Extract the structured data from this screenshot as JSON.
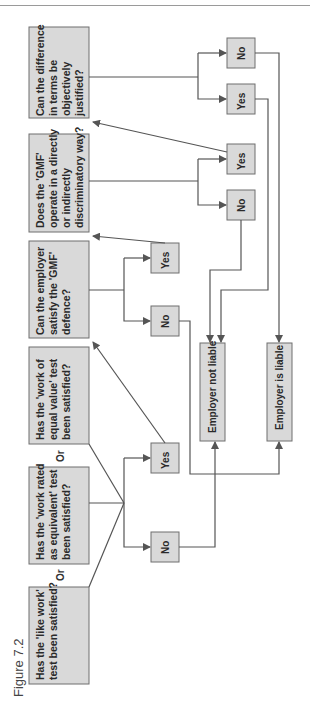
{
  "figure": {
    "caption": "Figure 7.2",
    "colors": {
      "box_fill": "#d9d9d9",
      "box_stroke": "#6e6e6e",
      "line": "#555555",
      "text": "#2a2a2a"
    }
  },
  "questions": {
    "like_work": [
      "Has the 'like work'",
      "test been satisfied?"
    ],
    "work_rated": [
      "Has the 'work rated",
      "as equivalent' test",
      "been satisfied?"
    ],
    "equal_value": [
      "Has the 'work of",
      "equal value' test",
      "been satisfied?"
    ],
    "gmf_defence": [
      "Can the employer",
      "satisfy the 'GMF'",
      "defence?"
    ],
    "gmf_discrim": [
      "Does the 'GMF'",
      "operate in a directly",
      "or indirectly",
      "discriminatory way?"
    ],
    "objective": [
      "Can the difference",
      "in terms be",
      "objectively",
      "justified?"
    ]
  },
  "connectors": {
    "or_1": "Or",
    "or_2": "Or"
  },
  "answers": {
    "test_no": "No",
    "test_yes": "Yes",
    "gmf_no": "No",
    "gmf_yes": "Yes",
    "discrim_no": "No",
    "discrim_yes": "Yes",
    "obj_yes": "Yes",
    "obj_no": "No"
  },
  "outcomes": {
    "not_liable": "Employer not liable",
    "is_liable": "Employer is liable"
  }
}
